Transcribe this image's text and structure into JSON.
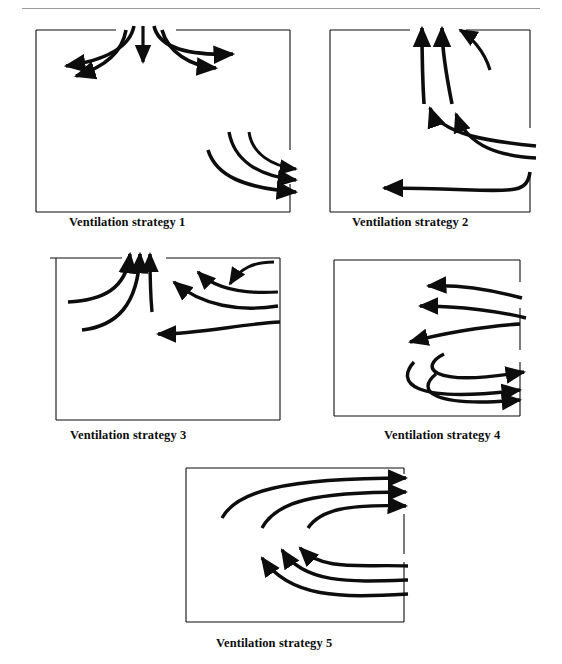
{
  "page": {
    "running_head": "",
    "background": "#ffffff",
    "ink": "#0d0d0d",
    "rule_color": "#9a9a9a"
  },
  "figure": {
    "kind": "ventilation-airflow-diagrams",
    "panel_count": 5,
    "panels": [
      {
        "id": "strategy-1",
        "caption": "Ventilation strategy 1",
        "box": {
          "x": 36,
          "y": 30,
          "w": 254,
          "h": 182
        },
        "supply": "top-centre downward jet splitting left and right along ceiling",
        "exhaust": "three curves leaving through right wall near floor",
        "openings": [
          {
            "side": "top",
            "from": 0.33,
            "to": 0.6
          },
          {
            "side": "right",
            "from": 0.66,
            "to": 0.86
          }
        ],
        "arrow_count": 8
      },
      {
        "id": "strategy-2",
        "caption": "Ventilation strategy 2",
        "box": {
          "x": 330,
          "y": 30,
          "w": 200,
          "h": 182
        },
        "supply": "two streams entering through right wall turning upward",
        "exhaust": "three arrows leaving through ceiling gap at upper right; one stream along floor to the left",
        "openings": [
          {
            "side": "top",
            "from": 0.42,
            "to": 0.72
          },
          {
            "side": "right",
            "from": 0.55,
            "to": 0.8
          }
        ],
        "arrow_count": 6
      },
      {
        "id": "strategy-3",
        "caption": "Ventilation strategy 3",
        "box": {
          "x": 56,
          "y": 256,
          "w": 224,
          "h": 162
        },
        "supply": "streams entering through right wall, rising and exiting ceiling centre",
        "exhaust": "three arrows through ceiling gap at centre",
        "openings": [
          {
            "side": "top",
            "from": 0.32,
            "to": 0.47
          },
          {
            "side": "right",
            "from": 0.0,
            "to": 0.3
          }
        ],
        "arrow_count": 7
      },
      {
        "id": "strategy-4",
        "caption": "Ventilation strategy 4",
        "box": {
          "x": 330,
          "y": 256,
          "w": 180,
          "h": 166
        },
        "supply": "three streams entering through upper right wall moving left",
        "exhaust": "three streams leaving through lower right wall",
        "openings": [
          {
            "side": "right",
            "from": 0.3,
            "to": 0.48
          },
          {
            "side": "right",
            "from": 0.62,
            "to": 0.95
          }
        ],
        "arrow_count": 6
      },
      {
        "id": "strategy-5",
        "caption": "Ventilation strategy 5",
        "box": {
          "x": 186,
          "y": 468,
          "w": 224,
          "h": 160
        },
        "supply": "three streams rising from lower right and exiting right wall at top",
        "exhaust": "three streams entering from lower right wall turning up-left",
        "openings": [
          {
            "side": "right",
            "from": 0.05,
            "to": 0.35
          },
          {
            "side": "right",
            "from": 0.62,
            "to": 0.95
          }
        ],
        "arrow_count": 6
      }
    ]
  },
  "captions": {
    "s1": "Ventilation strategy 1",
    "s2": "Ventilation strategy 2",
    "s3": "Ventilation strategy 3",
    "s4": "Ventilation strategy 4",
    "s5": "Ventilation strategy 5"
  }
}
